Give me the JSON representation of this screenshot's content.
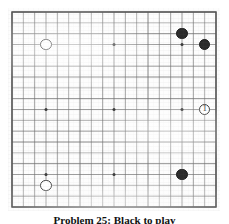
{
  "figure": {
    "kind": "go-board-diagram",
    "caption": "Problem 25: Black to play",
    "background_color": "#ffffff"
  },
  "board": {
    "size": 19,
    "columns": 19,
    "rows": 19,
    "line_color": "#6e6e6e",
    "border_color": "#555555",
    "board_color": "#fdfdfd",
    "star_point_color": "#3a3a3a",
    "star_points": [
      {
        "col": 4,
        "row": 4
      },
      {
        "col": 10,
        "row": 4
      },
      {
        "col": 16,
        "row": 4
      },
      {
        "col": 4,
        "row": 10
      },
      {
        "col": 10,
        "row": 10
      },
      {
        "col": 16,
        "row": 10
      },
      {
        "col": 4,
        "row": 16
      },
      {
        "col": 10,
        "row": 16
      },
      {
        "col": 16,
        "row": 16
      }
    ]
  },
  "stones": [
    {
      "id": "black-1",
      "color": "black",
      "col": 16,
      "row": 3,
      "label": "",
      "color_hex": "#2b2b2b"
    },
    {
      "id": "black-2",
      "color": "black",
      "col": 18,
      "row": 4,
      "label": "",
      "color_hex": "#2b2b2b"
    },
    {
      "id": "black-3",
      "color": "black",
      "col": 16,
      "row": 16,
      "label": "",
      "color_hex": "#2b2b2b"
    },
    {
      "id": "white-1",
      "color": "white",
      "col": 4,
      "row": 4,
      "label": "",
      "color_hex": "#ffffff"
    },
    {
      "id": "white-2",
      "color": "white",
      "col": 4,
      "row": 17,
      "label": "",
      "color_hex": "#ffffff"
    },
    {
      "id": "white-move-1",
      "color": "white",
      "col": 18,
      "row": 10,
      "label": "1",
      "color_hex": "#ffffff"
    }
  ],
  "legend": {
    "move_number_1": "1"
  }
}
